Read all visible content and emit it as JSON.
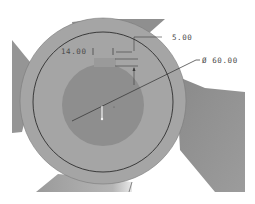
{
  "viewport": {
    "background": "#ffffff",
    "model_color": "#a3a3a3",
    "blade_color": "#8e8e8e",
    "bore_color": "#8c8c8c",
    "sketch_line_color": "#2a2a2a",
    "dimension_color": "#3a3a3a"
  },
  "dimensions": {
    "key_width": "14.00",
    "key_depth": "5.00",
    "diameter_symbol": "Ø",
    "diameter": "60.00"
  }
}
